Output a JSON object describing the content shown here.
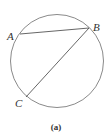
{
  "diagram": {
    "circle": {
      "cx": 57,
      "cy": 61,
      "r": 46.5,
      "stroke": "#8a8a8a"
    },
    "points": [
      {
        "name": "A",
        "x": 20,
        "y": 34,
        "label_x": 7,
        "label_y": 40
      },
      {
        "name": "B",
        "x": 89,
        "y": 28,
        "label_x": 93,
        "label_y": 31
      },
      {
        "name": "C",
        "x": 26,
        "y": 97,
        "label_x": 15,
        "label_y": 107
      }
    ],
    "chords": [
      {
        "from": "A",
        "to": "B"
      },
      {
        "from": "B",
        "to": "C"
      }
    ],
    "line_color": "#555555",
    "caption": "(a)"
  }
}
